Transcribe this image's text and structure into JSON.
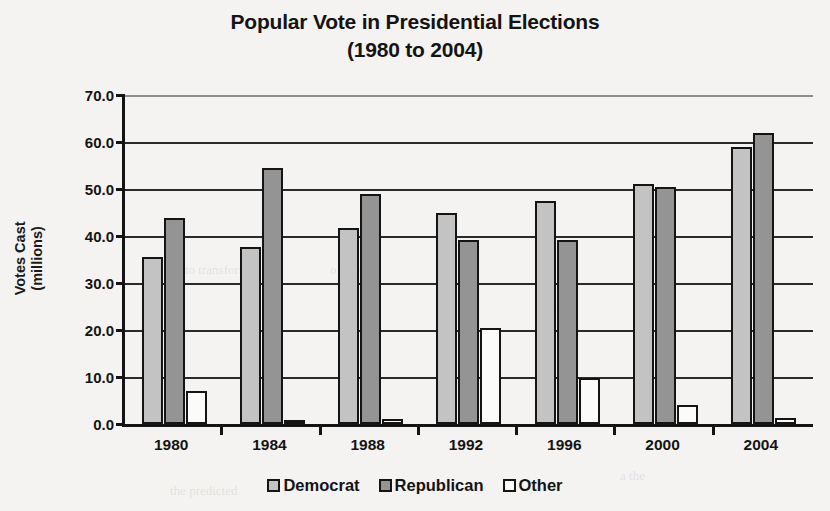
{
  "title": {
    "line1": "Popular Vote in Presidential Elections",
    "line2": "(1980 to 2004)"
  },
  "axes": {
    "y_title_line1": "Votes Cast",
    "y_title_line2": "(millions)",
    "y_ticks": [
      "70.0",
      "60.0",
      "50.0",
      "40.0",
      "30.0",
      "20.0",
      "10.0",
      "0.0"
    ]
  },
  "legend": {
    "items": [
      {
        "label": "Democrat",
        "color": "#c3c3c3"
      },
      {
        "label": "Republican",
        "color": "#949494"
      },
      {
        "label": "Other",
        "color": "#fbfbfa"
      }
    ]
  },
  "ghost_text": {
    "g1": "to transform",
    "g2": "of the",
    "g3": "your",
    "g4": "the predicted",
    "g5": "a the"
  },
  "chart_data": {
    "type": "bar",
    "title": "Popular Vote in Presidential Elections (1980 to 2004)",
    "xlabel": "",
    "ylabel": "Votes Cast (millions)",
    "ylim": [
      0,
      70
    ],
    "ytick_step": 10,
    "grid": true,
    "legend_position": "bottom",
    "categories": [
      "1980",
      "1984",
      "1988",
      "1992",
      "1996",
      "2000",
      "2004"
    ],
    "series": [
      {
        "name": "Democrat",
        "color": "#c3c3c3",
        "values": [
          35.5,
          37.6,
          41.8,
          44.9,
          47.4,
          51.0,
          59.0
        ]
      },
      {
        "name": "Republican",
        "color": "#949494",
        "values": [
          43.9,
          54.5,
          48.9,
          39.1,
          39.2,
          50.5,
          62.0
        ]
      },
      {
        "name": "Other",
        "color": "#fbfbfa",
        "values": [
          7.1,
          0.7,
          1.0,
          20.4,
          9.7,
          4.0,
          1.2
        ]
      }
    ]
  }
}
